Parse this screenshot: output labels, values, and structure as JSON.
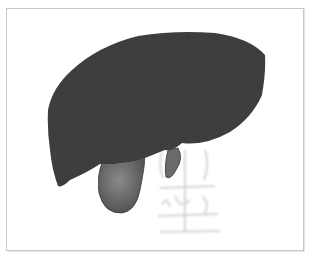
{
  "image": {
    "description": "3D volume rendering of a liver with gallbladder, grayscale",
    "subjects": [
      {
        "name": "liver",
        "color": "#3e3e3e"
      },
      {
        "name": "gallbladder",
        "color": "#6f6f6f"
      },
      {
        "name": "inferior-vena-cava-stub",
        "color": "#6a6a6a"
      },
      {
        "name": "vertebrae-ghost",
        "color": "#c4c4c4"
      }
    ],
    "frame": {
      "border_color": "#c8c8c8",
      "background": "#ffffff"
    }
  }
}
